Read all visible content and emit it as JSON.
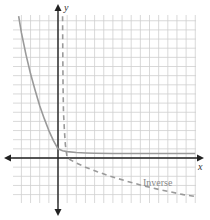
{
  "chart_data": {
    "type": "line",
    "title": "",
    "xlabel": "x",
    "ylabel": "y",
    "grid": true,
    "xlim": [
      -5,
      15
    ],
    "ylim": [
      -5,
      16
    ],
    "series": [
      {
        "name": "Function (exponential decay)",
        "style": "solid",
        "color": "#9a9a9a",
        "x": [
          -4.3,
          -4,
          -3.5,
          -3,
          -2.5,
          -2,
          -1.5,
          -1,
          -0.5,
          0,
          0.5,
          1,
          2,
          3,
          4,
          6,
          8,
          10,
          12,
          15
        ],
        "y": [
          15.5,
          13.7,
          11.3,
          9.2,
          7.4,
          5.7,
          4.3,
          3.0,
          1.9,
          1.0,
          0.8,
          0.7,
          0.6,
          0.55,
          0.52,
          0.5,
          0.5,
          0.5,
          0.5,
          0.5
        ]
      },
      {
        "name": "Inverse",
        "style": "dashed",
        "color": "#9a9a9a",
        "x": [
          0.5,
          0.52,
          0.55,
          0.6,
          0.7,
          0.8,
          1.0,
          1.9,
          3.0,
          4.3,
          5.7,
          7.4,
          9.2,
          11.3,
          13.7,
          15.0
        ],
        "y": [
          15.5,
          12,
          8,
          5,
          3,
          1.5,
          0,
          -0.5,
          -1.0,
          -1.5,
          -2.0,
          -2.5,
          -3.0,
          -3.5,
          -4.0,
          -4.2
        ]
      }
    ],
    "annotations": [
      {
        "text": "Inverse",
        "x": 9.5,
        "y": -2.8
      }
    ]
  },
  "axes": {
    "x_label": "x",
    "y_label": "y"
  },
  "legend": {
    "inverse_label": "Inverse"
  }
}
